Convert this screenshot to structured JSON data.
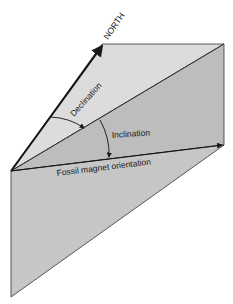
{
  "diagram": {
    "labels": {
      "north": "NORTH",
      "declination": "Declination",
      "inclination": "Inclination",
      "fossil_magnet": "Fossil magnet orientation"
    },
    "colors": {
      "horizontal_plane": "#d9d9d9",
      "vertical_plane": "#b9b9b9",
      "lower_face": "#c4c4c4",
      "lines": "#1a1a1a"
    }
  }
}
